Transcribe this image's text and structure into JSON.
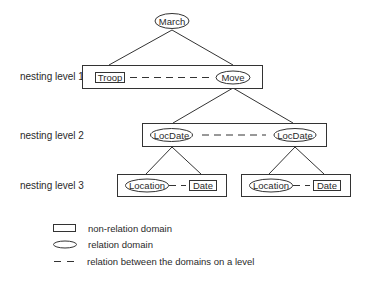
{
  "diagram": {
    "root": {
      "label": "March",
      "type": "relation"
    },
    "levels": [
      {
        "label": "nesting level 1",
        "groups": [
          {
            "nodes": [
              {
                "label": "Troop",
                "type": "non-relation"
              },
              {
                "label": "Move",
                "type": "relation"
              }
            ]
          }
        ]
      },
      {
        "label": "nesting level 2",
        "groups": [
          {
            "nodes": [
              {
                "label": "LocDate",
                "type": "relation"
              },
              {
                "label": "LocDate",
                "type": "relation"
              }
            ]
          }
        ]
      },
      {
        "label": "nesting level 3",
        "groups": [
          {
            "nodes": [
              {
                "label": "Location",
                "type": "relation"
              },
              {
                "label": "Date",
                "type": "non-relation"
              }
            ]
          },
          {
            "nodes": [
              {
                "label": "Location",
                "type": "relation"
              },
              {
                "label": "Date",
                "type": "non-relation"
              }
            ]
          }
        ]
      }
    ],
    "edges": [
      {
        "from": "March",
        "to": "nesting level 1 box"
      },
      {
        "from": "Move",
        "to": "nesting level 2 box"
      },
      {
        "from": "LocDate (left)",
        "to": "nesting level 3 left box"
      },
      {
        "from": "LocDate (right)",
        "to": "nesting level 3 right box"
      }
    ]
  },
  "legend": {
    "items": [
      {
        "symbol": "rectangle",
        "label": "non-relation domain"
      },
      {
        "symbol": "ellipse",
        "label": "relation domain"
      },
      {
        "symbol": "dashed-line",
        "label": "relation between the domains on a level"
      }
    ]
  },
  "colors": {
    "stroke": "#333333",
    "text": "#2a2a2a",
    "background": "#ffffff"
  }
}
